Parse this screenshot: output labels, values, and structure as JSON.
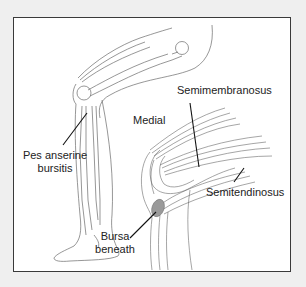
{
  "diagram": {
    "labels": {
      "pes_anserine_line1": "Pes anserine",
      "pes_anserine_line2": "bursitis",
      "medial": "Medial",
      "semimembranosus": "Semimembranosus",
      "semitendinosus": "Semitendinosus",
      "bursa_line1": "Bursa",
      "bursa_line2": "beneath"
    },
    "colors": {
      "background": "#efefef",
      "panel": "#ffffff",
      "border": "#3a3a3a",
      "outline": "#6a6a6a",
      "leader": "#111111",
      "bursa": "#8a8a8a"
    }
  }
}
